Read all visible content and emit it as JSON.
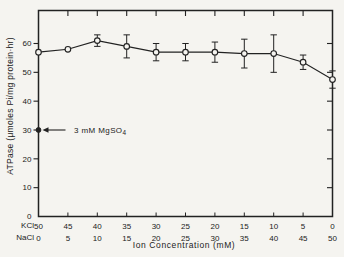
{
  "colors": {
    "ink": "#222222",
    "paper": "#f5f4f0"
  },
  "chart_data": {
    "type": "line",
    "title": "",
    "xlabel": "Ion Concentration (mM)",
    "ylabel": "ATPase (μmoles Pi/mg protein·hr)",
    "ylim": [
      0,
      71
    ],
    "grid": false,
    "legend": "none",
    "y_ticks": [
      0,
      10,
      20,
      30,
      40,
      50,
      60
    ],
    "x_axis_rows": [
      {
        "label": "KCl",
        "ticks": [
          "50",
          "45",
          "40",
          "35",
          "30",
          "25",
          "20",
          "15",
          "10",
          "5",
          "0"
        ]
      },
      {
        "label": "NaCl",
        "ticks": [
          "0",
          "5",
          "10",
          "15",
          "20",
          "25",
          "30",
          "35",
          "40",
          "45",
          "50"
        ]
      }
    ],
    "series": [
      {
        "name": "ATPase activity in KCl/NaCl mixtures",
        "marker": "open-circle",
        "values": [
          57,
          58,
          61,
          59,
          57,
          57,
          57,
          56.5,
          56.5,
          53.5,
          47.5
        ],
        "errors": [
          0,
          0,
          2,
          4,
          3,
          3,
          3.5,
          5,
          6.5,
          2.5,
          3
        ]
      }
    ],
    "annotation_point": {
      "label_main": "3 mM MgSO",
      "label_sub": "4",
      "value": 30,
      "marker": "filled-circle"
    }
  }
}
